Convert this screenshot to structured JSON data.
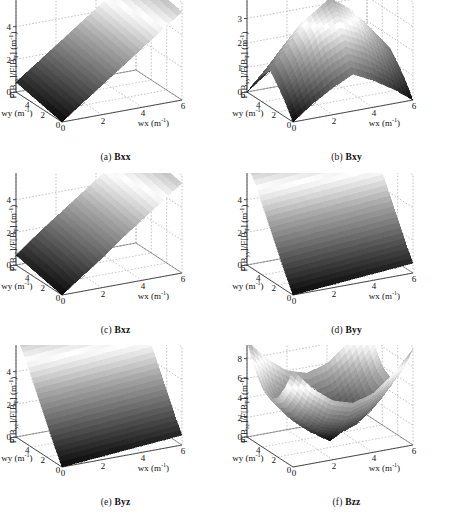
{
  "figure": {
    "type": "multi-panel-3d-surface-grid",
    "rows": 3,
    "cols": 2,
    "panel_count": 6,
    "colormap": "grayscale-hot (black low, white high)",
    "background": "#ffffff",
    "axis_color": "#555555",
    "grid_style": "dotted"
  },
  "axes_common": {
    "xlabel": "wx (m",
    "xlabel_sup": "-1",
    "xlabel_tail": ")",
    "ylabel": "wy (m",
    "ylabel_sup": "-1",
    "ylabel_tail": ")",
    "x_ticks": [
      "0",
      "2",
      "4",
      "6"
    ],
    "y_ticks": [
      "6",
      "4",
      "2",
      "0"
    ],
    "xlim": [
      0,
      6
    ],
    "ylim": [
      0,
      6
    ],
    "unit": "m-1"
  },
  "panels": [
    {
      "id": "a",
      "caption_index": "(a)",
      "caption_name": "Bxx",
      "zlabel_prefix": "F[B",
      "zlabel_sub": "xx",
      "zlabel_mid": "]/F[B",
      "zlabel_sub2": "T",
      "zlabel_suffix": "]  (m",
      "zlabel_sup": "-1",
      "zlabel_tail": ")",
      "z_ticks": [
        "0",
        "2",
        "4",
        "6"
      ],
      "zlim": [
        0,
        6
      ],
      "surface_shape": "tilted ramp rising toward +wx with bright diagonal ridge",
      "peak_value": 6.0
    },
    {
      "id": "b",
      "caption_index": "(b)",
      "caption_name": "Bxy",
      "zlabel_prefix": "F[B",
      "zlabel_sub": "xy",
      "zlabel_mid": "]/F[B",
      "zlabel_sub2": "T",
      "zlabel_suffix": "]  (m",
      "zlabel_sup": "-1",
      "zlabel_tail": ")",
      "z_ticks": [
        "0",
        "1",
        "2",
        "3",
        "4"
      ],
      "zlim": [
        0,
        4
      ],
      "surface_shape": "central peak / pyramid with bright annular ring",
      "peak_value": 4.0
    },
    {
      "id": "c",
      "caption_index": "(c)",
      "caption_name": "Bxz",
      "zlabel_prefix": "F[B",
      "zlabel_sub": "xz",
      "zlabel_mid": "]/F[B",
      "zlabel_sub2": "T",
      "zlabel_suffix": "]  (m",
      "zlabel_sup": "-1",
      "zlabel_tail": ")",
      "z_ticks": [
        "0",
        "2",
        "4",
        "6"
      ],
      "zlim": [
        0,
        6
      ],
      "surface_shape": "tilted ramp rising toward +wx with bright band",
      "peak_value": 6.0
    },
    {
      "id": "d",
      "caption_index": "(d)",
      "caption_name": "Byy",
      "zlabel_prefix": "F[B",
      "zlabel_sub": "yy",
      "zlabel_mid": "]/F[B",
      "zlabel_sub2": "T",
      "zlabel_suffix": "]  (m",
      "zlabel_sup": "-1",
      "zlabel_tail": ")",
      "z_ticks": [
        "0",
        "2",
        "4",
        "6"
      ],
      "zlim": [
        0,
        6
      ],
      "surface_shape": "tilted ramp rising toward +wy, bright band near left edge",
      "peak_value": 6.5
    },
    {
      "id": "e",
      "caption_index": "(e)",
      "caption_name": "Byz",
      "zlabel_prefix": "F[B",
      "zlabel_sub": "yz",
      "zlabel_mid": "]/F[B",
      "zlabel_sub2": "T",
      "zlabel_suffix": "]  (m",
      "zlabel_sup": "-1",
      "zlabel_tail": ")",
      "z_ticks": [
        "0",
        "2",
        "4",
        "6"
      ],
      "zlim": [
        0,
        6
      ],
      "surface_shape": "tilted ramp rising toward +wy with bright horizontal band",
      "peak_value": 6.5
    },
    {
      "id": "f",
      "caption_index": "(f)",
      "caption_name": "Bzz",
      "zlabel_prefix": "F[B",
      "zlabel_sub": "zz",
      "zlabel_mid": "]/F[B",
      "zlabel_sub2": "T",
      "zlabel_suffix": "]  (m",
      "zlabel_sup": "-1",
      "zlabel_tail": ")",
      "z_ticks": [
        "0",
        "2",
        "4",
        "6",
        "8",
        "10"
      ],
      "zlim": [
        0,
        10
      ],
      "surface_shape": "saddle / upward-curving bowl with bright mid-level band",
      "peak_value": 10.0
    }
  ],
  "chart_data": {
    "type": "surface",
    "title": "",
    "xlabel": "wx (m^-1)",
    "ylabel": "wy (m^-1)",
    "xlim": [
      0,
      6
    ],
    "ylim": [
      0,
      6
    ],
    "grid": true,
    "legend": "none",
    "colormap": "gray",
    "panels": [
      {
        "name": "(a) Bxx",
        "zlabel": "F[Bxx]/F[BT] (m^-1)",
        "zlim": [
          0,
          6
        ],
        "z_ticks": [
          0,
          2,
          4,
          6
        ],
        "x": [
          0,
          1,
          2,
          3,
          4,
          5,
          6
        ],
        "y": [
          0,
          1,
          2,
          3,
          4,
          5,
          6
        ],
        "z": [
          [
            0.0,
            0.9,
            1.8,
            2.7,
            3.6,
            4.5,
            5.4
          ],
          [
            0.1,
            1.0,
            1.9,
            2.8,
            3.7,
            4.6,
            5.5
          ],
          [
            0.2,
            1.1,
            2.0,
            2.9,
            3.8,
            4.7,
            5.6
          ],
          [
            0.3,
            1.2,
            2.1,
            3.0,
            3.9,
            4.8,
            5.7
          ],
          [
            0.4,
            1.3,
            2.2,
            3.1,
            4.0,
            4.9,
            5.8
          ],
          [
            0.5,
            1.4,
            2.3,
            3.2,
            4.1,
            5.0,
            5.9
          ],
          [
            0.6,
            1.5,
            2.4,
            3.3,
            4.2,
            5.1,
            6.0
          ]
        ]
      },
      {
        "name": "(b) Bxy",
        "zlabel": "F[Bxy]/F[BT] (m^-1)",
        "zlim": [
          0,
          4
        ],
        "z_ticks": [
          0,
          1,
          2,
          3,
          4
        ],
        "x": [
          0,
          1,
          2,
          3,
          4,
          5,
          6
        ],
        "y": [
          0,
          1,
          2,
          3,
          4,
          5,
          6
        ],
        "z": [
          [
            0.0,
            0.6,
            1.1,
            1.5,
            1.1,
            0.6,
            0.0
          ],
          [
            0.6,
            1.4,
            2.1,
            2.5,
            2.1,
            1.4,
            0.6
          ],
          [
            1.1,
            2.1,
            3.0,
            3.4,
            3.0,
            2.1,
            1.1
          ],
          [
            1.5,
            2.5,
            3.4,
            4.0,
            3.4,
            2.5,
            1.5
          ],
          [
            1.1,
            2.1,
            3.0,
            3.4,
            3.0,
            2.1,
            1.1
          ],
          [
            0.6,
            1.4,
            2.1,
            2.5,
            2.1,
            1.4,
            0.6
          ],
          [
            0.0,
            0.6,
            1.1,
            1.5,
            1.1,
            0.6,
            0.0
          ]
        ]
      },
      {
        "name": "(c) Bxz",
        "zlabel": "F[Bxz]/F[BT] (m^-1)",
        "zlim": [
          0,
          6
        ],
        "z_ticks": [
          0,
          2,
          4,
          6
        ],
        "x": [
          0,
          1,
          2,
          3,
          4,
          5,
          6
        ],
        "y": [
          0,
          1,
          2,
          3,
          4,
          5,
          6
        ],
        "z": [
          [
            0.0,
            0.9,
            1.8,
            2.8,
            3.7,
            4.6,
            5.5
          ],
          [
            0.1,
            1.0,
            2.0,
            2.9,
            3.8,
            4.7,
            5.6
          ],
          [
            0.2,
            1.2,
            2.1,
            3.0,
            3.9,
            4.8,
            5.7
          ],
          [
            0.3,
            1.3,
            2.2,
            3.1,
            4.0,
            4.9,
            5.8
          ],
          [
            0.4,
            1.4,
            2.3,
            3.2,
            4.1,
            5.0,
            5.9
          ],
          [
            0.5,
            1.5,
            2.4,
            3.3,
            4.2,
            5.1,
            6.0
          ],
          [
            0.6,
            1.6,
            2.5,
            3.4,
            4.3,
            5.2,
            6.1
          ]
        ]
      },
      {
        "name": "(d) Byy",
        "zlabel": "F[Byy]/F[BT] (m^-1)",
        "zlim": [
          0,
          6
        ],
        "z_ticks": [
          0,
          2,
          4,
          6
        ],
        "x": [
          0,
          1,
          2,
          3,
          4,
          5,
          6
        ],
        "y": [
          0,
          1,
          2,
          3,
          4,
          5,
          6
        ],
        "z": [
          [
            0.0,
            0.1,
            0.2,
            0.3,
            0.4,
            0.5,
            0.6
          ],
          [
            1.0,
            1.1,
            1.2,
            1.3,
            1.4,
            1.5,
            1.6
          ],
          [
            2.1,
            2.2,
            2.3,
            2.4,
            2.5,
            2.6,
            2.7
          ],
          [
            3.2,
            3.3,
            3.4,
            3.5,
            3.6,
            3.7,
            3.8
          ],
          [
            4.3,
            4.4,
            4.5,
            4.6,
            4.7,
            4.8,
            4.9
          ],
          [
            5.4,
            5.5,
            5.6,
            5.7,
            5.8,
            5.9,
            6.0
          ],
          [
            6.3,
            6.4,
            6.5,
            6.5,
            6.5,
            6.5,
            6.5
          ]
        ]
      },
      {
        "name": "(e) Byz",
        "zlabel": "F[Byz]/F[BT] (m^-1)",
        "zlim": [
          0,
          6
        ],
        "z_ticks": [
          0,
          2,
          4,
          6
        ],
        "x": [
          0,
          1,
          2,
          3,
          4,
          5,
          6
        ],
        "y": [
          0,
          1,
          2,
          3,
          4,
          5,
          6
        ],
        "z": [
          [
            0.0,
            0.1,
            0.2,
            0.3,
            0.4,
            0.5,
            0.6
          ],
          [
            1.0,
            1.1,
            1.2,
            1.3,
            1.4,
            1.5,
            1.6
          ],
          [
            2.1,
            2.2,
            2.3,
            2.4,
            2.5,
            2.6,
            2.7
          ],
          [
            3.2,
            3.3,
            3.4,
            3.5,
            3.6,
            3.7,
            3.8
          ],
          [
            4.3,
            4.4,
            4.5,
            4.6,
            4.7,
            4.8,
            4.9
          ],
          [
            5.4,
            5.5,
            5.6,
            5.7,
            5.8,
            5.9,
            6.0
          ],
          [
            6.3,
            6.4,
            6.5,
            6.5,
            6.5,
            6.5,
            6.5
          ]
        ]
      },
      {
        "name": "(f) Bzz",
        "zlabel": "F[Bzz]/F[BT] (m^-1)",
        "zlim": [
          0,
          10
        ],
        "z_ticks": [
          0,
          2,
          4,
          6,
          8,
          10
        ],
        "x": [
          0,
          1,
          2,
          3,
          4,
          5,
          6
        ],
        "y": [
          0,
          1,
          2,
          3,
          4,
          5,
          6
        ],
        "z": [
          [
            9.8,
            7.6,
            6.0,
            5.4,
            6.0,
            7.6,
            9.8
          ],
          [
            7.6,
            5.2,
            3.6,
            3.0,
            3.6,
            5.2,
            7.6
          ],
          [
            6.0,
            3.6,
            1.9,
            1.3,
            1.9,
            3.6,
            6.0
          ],
          [
            5.4,
            3.0,
            1.3,
            0.0,
            1.3,
            3.0,
            5.4
          ],
          [
            6.0,
            3.6,
            1.9,
            1.3,
            1.9,
            3.6,
            6.0
          ],
          [
            7.6,
            5.2,
            3.6,
            3.0,
            3.6,
            5.2,
            7.6
          ],
          [
            9.8,
            7.6,
            6.0,
            5.4,
            6.0,
            7.6,
            9.8
          ]
        ]
      }
    ]
  }
}
